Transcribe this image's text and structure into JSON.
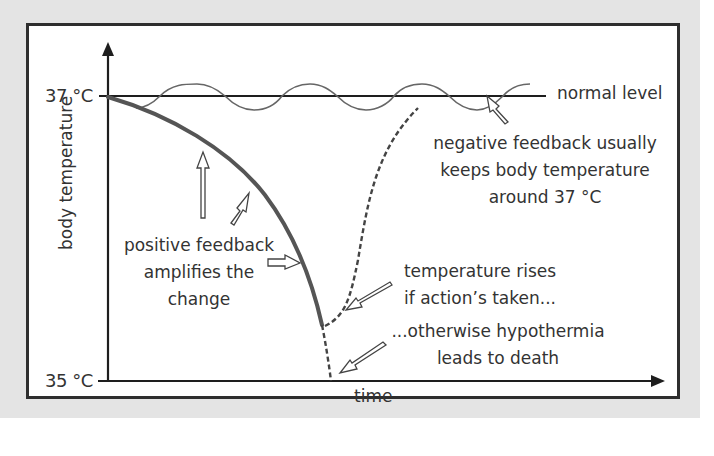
{
  "diagram": {
    "title": "",
    "y_axis": {
      "label": "body temperature",
      "ticks": [
        "37 °C",
        "35 °C"
      ]
    },
    "x_axis": {
      "label": "time"
    },
    "normal_line_label": "normal level",
    "annotations": {
      "negative_feedback": [
        "negative feedback usually",
        "keeps body temperature",
        "around 37 °C"
      ],
      "positive_feedback": [
        "positive feedback",
        "amplifies the",
        "change"
      ],
      "temperature_rises": [
        "temperature rises",
        "if action’s taken..."
      ],
      "hypothermia": [
        "...otherwise hypothermia",
        "leads to death"
      ]
    },
    "colors": {
      "axis": "#1e1e1e",
      "curve_positive": "#555555",
      "wave": "#666666",
      "text": "#333333",
      "background": "#e4e4e4"
    }
  }
}
